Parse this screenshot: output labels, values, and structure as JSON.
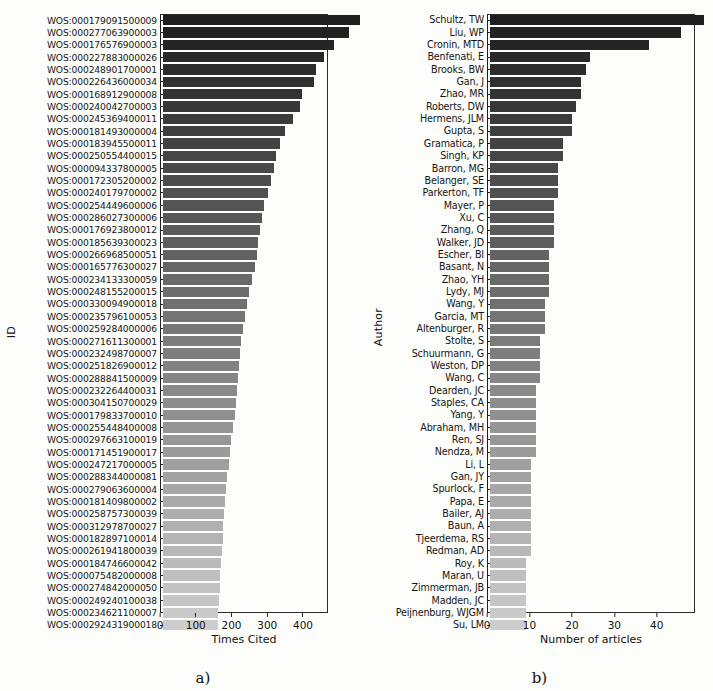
{
  "figure": {
    "panels": [
      {
        "caption": "a)",
        "ylabel": "ID",
        "xlabel": "Times Cited",
        "xticks": [
          0,
          100,
          200,
          300,
          400
        ],
        "xlim": [
          0,
          470
        ]
      },
      {
        "caption": "b)",
        "ylabel": "Author",
        "xlabel": "Number of articles",
        "xticks": [
          0,
          10,
          20,
          30,
          40
        ],
        "xlim": [
          0,
          49
        ]
      }
    ]
  },
  "chart_data": [
    {
      "type": "bar",
      "orientation": "horizontal",
      "title": "",
      "xlabel": "Times Cited",
      "ylabel": "ID",
      "xlim": [
        0,
        470
      ],
      "xticks": [
        0,
        100,
        200,
        300,
        400
      ],
      "grid": false,
      "legend": "none",
      "colormap": "grayscale-dark-to-light",
      "categories": [
        "WOS:000179091500009",
        "WOS:000277063900003",
        "WOS:000176576900003",
        "WOS:000227883000026",
        "WOS:000248901700001",
        "WOS:000226436000034",
        "WOS:000168912900008",
        "WOS:000240042700003",
        "WOS:000245369400011",
        "WOS:000181493000004",
        "WOS:000183945500011",
        "WOS:000250554400015",
        "WOS:000094337800005",
        "WOS:000172305200002",
        "WOS:000240179700002",
        "WOS:000254449600006",
        "WOS:000286027300006",
        "WOS:000176923800012",
        "WOS:000185639300023",
        "WOS:000266968500051",
        "WOS:000165776300027",
        "WOS:000234133300059",
        "WOS:000248155200015",
        "WOS:000330094900018",
        "WOS:000235796100053",
        "WOS:000259284000006",
        "WOS:000271611300001",
        "WOS:000232498700007",
        "WOS:000251826900012",
        "WOS:000288841500009",
        "WOS:000232264400031",
        "WOS:000304150700029",
        "WOS:000179833700010",
        "WOS:000255448400008",
        "WOS:000297663100019",
        "WOS:000171451900017",
        "WOS:000247217000005",
        "WOS:000288344000081",
        "WOS:000279063600004",
        "WOS:000181409800002",
        "WOS:000258757300039",
        "WOS:000312978700027",
        "WOS:000182897100014",
        "WOS:000261941800039",
        "WOS:000184746600042",
        "WOS:000075482000008",
        "WOS:000274842000050",
        "WOS:000249240100038",
        "WOS:000234621100007",
        "WOS:000292431900018"
      ],
      "values": [
        455,
        430,
        397,
        372,
        355,
        350,
        322,
        318,
        300,
        283,
        270,
        262,
        258,
        251,
        242,
        234,
        229,
        225,
        220,
        217,
        213,
        206,
        200,
        194,
        190,
        186,
        181,
        178,
        175,
        173,
        172,
        170,
        166,
        163,
        158,
        155,
        152,
        148,
        146,
        144,
        142,
        140,
        139,
        137,
        135,
        133,
        131,
        130,
        128,
        127
      ]
    },
    {
      "type": "bar",
      "orientation": "horizontal",
      "title": "",
      "xlabel": "Number of articles",
      "ylabel": "Author",
      "xlim": [
        0,
        49
      ],
      "xticks": [
        0,
        10,
        20,
        30,
        40
      ],
      "grid": false,
      "legend": "none",
      "colormap": "grayscale-dark-to-light",
      "categories": [
        "Schultz, TW",
        "Liu, WP",
        "Cronin, MTD",
        "Benfenati, E",
        "Brooks, BW",
        "Gan, J",
        "Zhao, MR",
        "Roberts, DW",
        "Hermens, JLM",
        "Gupta, S",
        "Gramatica, P",
        "Singh, KP",
        "Barron, MG",
        "Belanger, SE",
        "Parkerton, TF",
        "Mayer, P",
        "Xu, C",
        "Zhang, Q",
        "Walker, JD",
        "Escher, BI",
        "Basant, N",
        "Zhao, YH",
        "Lydy, MJ",
        "Wang, Y",
        "Garcia, MT",
        "Altenburger, R",
        "Stolte, S",
        "Schuurmann, G",
        "Weston, DP",
        "Wang, C",
        "Dearden, JC",
        "Staples, CA",
        "Yang, Y",
        "Abraham, MH",
        "Ren, SJ",
        "Nendza, M",
        "Li, L",
        "Gan, JY",
        "Spurlock, F",
        "Papa, E",
        "Bailer, AJ",
        "Baun, A",
        "Tjeerdema, RS",
        "Redman, AD",
        "Roy, K",
        "Maran, U",
        "Zimmerman, JB",
        "Madden, JC",
        "Peijnenburg, WJGM",
        "Su, LM"
      ],
      "values": [
        47,
        42,
        35,
        22,
        21,
        20,
        20,
        19,
        18,
        18,
        16,
        16,
        15,
        15,
        15,
        14,
        14,
        14,
        14,
        13,
        13,
        13,
        13,
        12,
        12,
        12,
        11,
        11,
        11,
        11,
        10,
        10,
        10,
        10,
        10,
        10,
        9,
        9,
        9,
        9,
        9,
        9,
        9,
        9,
        8,
        8,
        8,
        8,
        8,
        8
      ]
    }
  ]
}
